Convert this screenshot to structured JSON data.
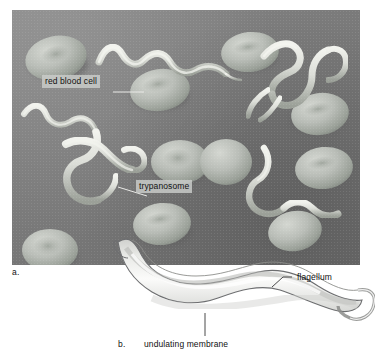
{
  "figure": {
    "panels": [
      {
        "letter": "a.",
        "name": "micrograph",
        "type": "scanning electron micrograph",
        "subject": "trypanosomes among human red blood cells",
        "background_color": "#7c7c7c",
        "cell_color": "#b8bcb6"
      },
      {
        "letter": "b.",
        "name": "illustration",
        "type": "line drawing",
        "subject": "single trypanosome",
        "background_color": "#ffffff"
      }
    ],
    "labels": [
      {
        "id": "red-blood-cell",
        "text": "red blood cell",
        "panel": "a.",
        "boxed": true
      },
      {
        "id": "trypanosome",
        "text": "trypanosome",
        "panel": "a.",
        "boxed": true
      },
      {
        "id": "flagellum",
        "text": "flagellum",
        "panel": "b.",
        "boxed": false
      },
      {
        "id": "undulating-membrane",
        "text": "undulating membrane",
        "panel": "b.",
        "boxed": false
      }
    ]
  },
  "panel_a": {
    "letter": "a.",
    "label_red_blood_cell": "red blood cell",
    "label_trypanosome": "trypanosome"
  },
  "panel_b": {
    "letter": "b.",
    "label_flagellum": "flagellum",
    "label_undulating_membrane": "undulating membrane"
  },
  "colors": {
    "micrograph_background": "#7c7c7c",
    "red_blood_cell": "#b8bcb6",
    "trypanosome_highlight": "#e6e8e2",
    "label_text": "#111111",
    "label_box": "#cbcdca",
    "illustration_outline": "#6d6e70",
    "page_background": "#ffffff"
  }
}
